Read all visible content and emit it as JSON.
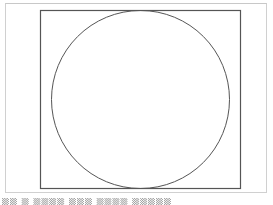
{
  "figure": {
    "rectangle": {
      "x": 40,
      "y": 10,
      "width": 200,
      "height": 178,
      "stroke": "#555555"
    },
    "circle": {
      "cx": 140.5,
      "cy": 99,
      "r": 89,
      "stroke": "#555555"
    },
    "frame_color": "#d0d0d0"
  },
  "caption": {
    "text": "▒▒ ▒ ▒▒▒▒ ▒▒▒ ▒▒▒▒ ▒▒▒▒▒"
  }
}
